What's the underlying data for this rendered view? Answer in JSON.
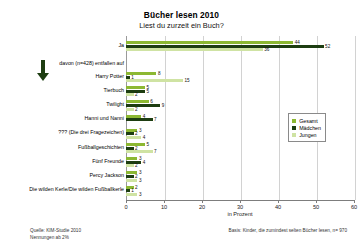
{
  "chart_data": {
    "type": "bar",
    "orientation": "horizontal",
    "title": "Bücher lesen 2010",
    "subtitle": "Liest du zurzeit ein Buch?",
    "xlabel": "in Prozent",
    "ylabel": "",
    "xlim": [
      0,
      60
    ],
    "xticks": [
      0,
      10,
      20,
      30,
      40,
      50,
      60
    ],
    "grid": true,
    "legend_position": "right",
    "legend": [
      "Gesamt",
      "Mädchen",
      "Jungen"
    ],
    "colors": {
      "gesamt": "#8cb832",
      "maedchen": "#1d3d11",
      "jungen": "#cfe3a3"
    },
    "annotation": "davon (n=428) entfallen auf",
    "categories": [
      "Ja",
      "Harry Potter",
      "Tierbuch",
      "Twilight",
      "Hanni und Nanni",
      "??? (Die drei Fragezeichen)",
      "Fußballgeschichten",
      "Fünf Freunde",
      "Percy Jackson",
      "Die wilden Kerle/Die wilden Fußballkerle"
    ],
    "series": [
      {
        "name": "Gesamt",
        "values": [
          44,
          8,
          5,
          6,
          4,
          3,
          5,
          3,
          3,
          2
        ]
      },
      {
        "name": "Mädchen",
        "values": [
          52,
          1,
          5,
          9,
          7,
          2,
          2,
          4,
          2,
          1
        ]
      },
      {
        "name": "Jungen",
        "values": [
          36,
          15,
          2,
          2,
          0,
          4,
          7,
          2,
          3,
          3
        ]
      }
    ]
  },
  "footer": {
    "source_line1": "Quelle: KIM-Studie 2010",
    "source_line2": "Nennungen ab 2%",
    "basis": "Basis: Kinder, die zumindest selten Bücher lesen, n= 970"
  },
  "icons": {
    "arrow": "down-arrow-icon"
  }
}
